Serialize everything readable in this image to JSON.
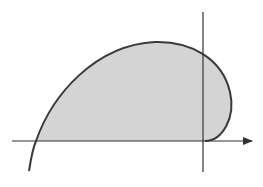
{
  "diagram": {
    "type": "shaded-region-curve",
    "width": 263,
    "height": 187,
    "colors": {
      "background": "#ffffff",
      "axis": "#333333",
      "curve": "#3a3a3a",
      "fill": "#d4d4d4"
    },
    "axes": {
      "x_axis": {
        "x1": 12,
        "y": 141,
        "x2": 252,
        "arrow_tip": 258
      },
      "y_axis": {
        "x": 203,
        "y1": 12,
        "y2": 172
      }
    },
    "curve": {
      "description": "Closed loop curve starting below x-axis on the left, rising to a peak, crossing the y-axis, bulging right and returning tangent to the x-axis near the origin",
      "path": "M 29 171 C 31 158, 33 148, 36 141 C 52 95, 95 45, 155 42 C 190 41, 222 58, 230 92 C 236 118, 222 141, 205 141",
      "region_path": "M 36 141 C 52 95, 95 45, 155 42 C 190 41, 222 58, 230 92 C 236 118, 222 141, 205 141 Z"
    }
  }
}
